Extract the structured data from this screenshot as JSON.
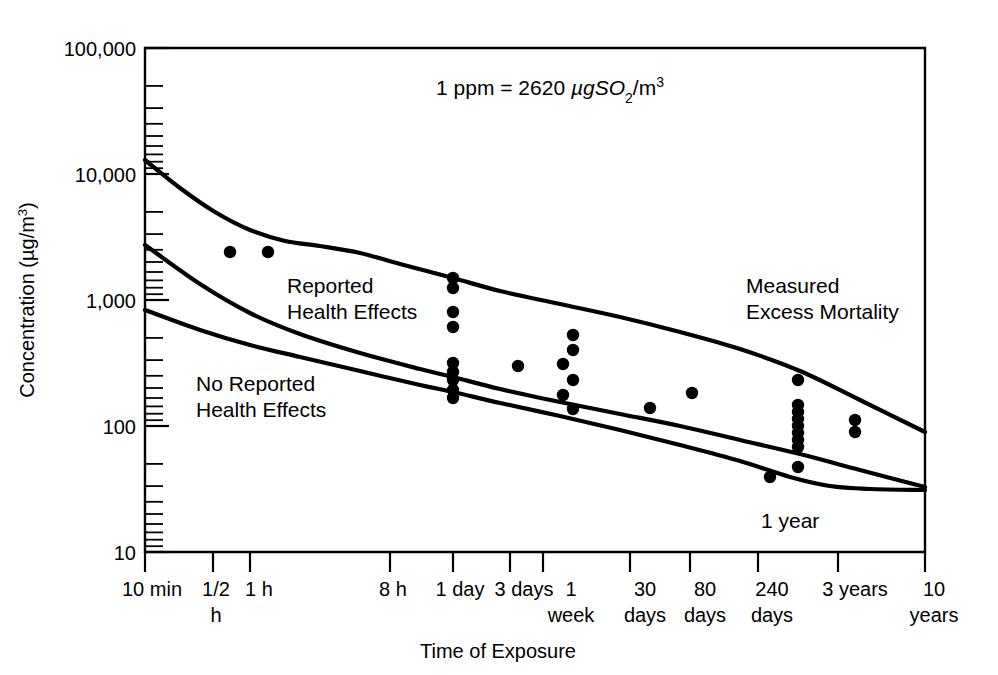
{
  "chart_data": {
    "type": "scatter",
    "title": "",
    "xlabel": "Time of Exposure",
    "ylabel": "Concentration (µg/m³)",
    "ylabel_main": "Concentration (",
    "ylabel_unit": "µg/m",
    "ylabel_exp": "3",
    "ylabel_close": ")",
    "yscale": "log",
    "ylim": [
      10,
      100000
    ],
    "ytick_labels": [
      "100,000",
      "10,000",
      "1,000",
      "100",
      "10"
    ],
    "ytick_values": [
      100000,
      10000,
      1000,
      100,
      10
    ],
    "grid": false,
    "legend": "none",
    "xscale": "log-time",
    "xtick_labels": [
      {
        "line1": "10 min",
        "line2": ""
      },
      {
        "line1": "1/2",
        "line2": "h"
      },
      {
        "line1": "1 h",
        "line2": ""
      },
      {
        "line1": "8 h",
        "line2": ""
      },
      {
        "line1": "1 day",
        "line2": ""
      },
      {
        "line1": "3 days",
        "line2": ""
      },
      {
        "line1": "1",
        "line2": "week"
      },
      {
        "line1": "30",
        "line2": "days"
      },
      {
        "line1": "80",
        "line2": "days"
      },
      {
        "line1": "240",
        "line2": "days"
      },
      {
        "line1": "3 years",
        "line2": ""
      },
      {
        "line1": "10",
        "line2": "years"
      }
    ],
    "xtick_minutes": [
      10,
      30,
      60,
      480,
      1440,
      4320,
      10080,
      43200,
      115200,
      345600,
      1576800,
      5256000
    ],
    "annotations": [
      {
        "name": "conversion-note",
        "text_parts": [
          "1 ppm = 2620 ",
          "µgSO",
          "2",
          "/m",
          "3"
        ],
        "text": "1 ppm = 2620 µgSO2/m3"
      },
      {
        "name": "reported-health-effects",
        "line1": "Reported",
        "line2": "Health Effects"
      },
      {
        "name": "no-reported-health-effects",
        "line1": "No Reported",
        "line2": "Health Effects"
      },
      {
        "name": "measured-excess-mortality",
        "line1": "Measured",
        "line2": "Excess Mortality"
      },
      {
        "name": "one-year-marker",
        "text": "1 year"
      }
    ],
    "curves": [
      {
        "name": "upper-boundary-curve",
        "label": "Upper boundary (measured excess mortality / reported health effects)",
        "points_xy": [
          [
            145,
            160
          ],
          [
            180,
            188
          ],
          [
            215,
            212
          ],
          [
            250,
            230
          ],
          [
            285,
            241
          ],
          [
            320,
            246
          ],
          [
            360,
            253
          ],
          [
            400,
            264
          ],
          [
            453,
            278
          ],
          [
            500,
            291
          ],
          [
            560,
            304
          ],
          [
            620,
            317
          ],
          [
            680,
            332
          ],
          [
            740,
            349
          ],
          [
            800,
            371
          ],
          [
            860,
            400
          ],
          [
            925,
            432
          ]
        ]
      },
      {
        "name": "middle-boundary-curve",
        "label": "Middle boundary",
        "points_xy": [
          [
            145,
            245
          ],
          [
            200,
            284
          ],
          [
            250,
            313
          ],
          [
            300,
            334
          ],
          [
            360,
            353
          ],
          [
            420,
            369
          ],
          [
            453,
            377
          ],
          [
            500,
            389
          ],
          [
            560,
            402
          ],
          [
            620,
            414
          ],
          [
            680,
            426
          ],
          [
            740,
            440
          ],
          [
            800,
            454
          ],
          [
            860,
            470
          ],
          [
            925,
            487
          ]
        ]
      },
      {
        "name": "lower-boundary-curve",
        "label": "Lower boundary (no reported health effects)",
        "points_xy": [
          [
            145,
            310
          ],
          [
            200,
            330
          ],
          [
            250,
            345
          ],
          [
            300,
            357
          ],
          [
            360,
            371
          ],
          [
            420,
            385
          ],
          [
            453,
            392
          ],
          [
            500,
            403
          ],
          [
            560,
            416
          ],
          [
            620,
            430
          ],
          [
            680,
            445
          ],
          [
            740,
            461
          ],
          [
            790,
            477
          ],
          [
            830,
            486
          ],
          [
            870,
            489
          ],
          [
            925,
            490
          ]
        ]
      }
    ],
    "data_points_xy": [
      [
        230,
        252
      ],
      [
        268,
        252
      ],
      [
        453,
        278
      ],
      [
        453,
        288
      ],
      [
        453,
        312
      ],
      [
        453,
        327
      ],
      [
        453,
        363
      ],
      [
        453,
        372
      ],
      [
        453,
        380
      ],
      [
        453,
        390
      ],
      [
        453,
        398
      ],
      [
        518,
        366
      ],
      [
        563,
        364
      ],
      [
        563,
        395
      ],
      [
        573,
        335
      ],
      [
        573,
        350
      ],
      [
        573,
        380
      ],
      [
        573,
        409
      ],
      [
        650,
        408
      ],
      [
        692,
        393
      ],
      [
        770,
        477
      ],
      [
        798,
        380
      ],
      [
        798,
        405
      ],
      [
        798,
        412
      ],
      [
        798,
        419
      ],
      [
        798,
        426
      ],
      [
        798,
        433
      ],
      [
        798,
        440
      ],
      [
        798,
        447
      ],
      [
        798,
        467
      ],
      [
        855,
        420
      ],
      [
        855,
        432
      ]
    ]
  },
  "plot": {
    "x_left": 145,
    "x_right": 925,
    "y_top": 48,
    "y_bottom": 552
  }
}
